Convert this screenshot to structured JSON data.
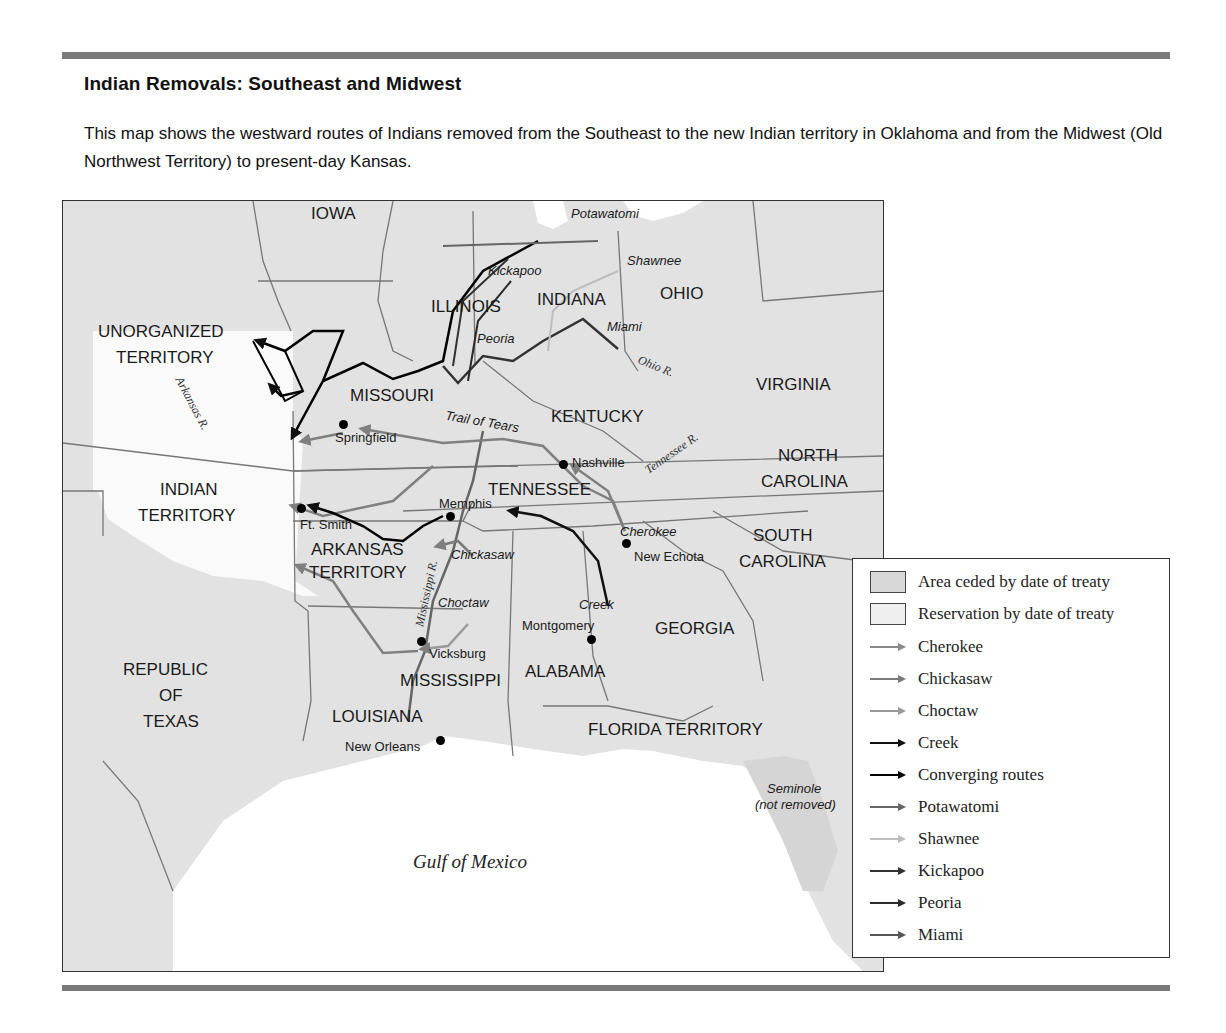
{
  "header": {
    "title": "Indian Removals: Southeast and Midwest",
    "description": "This map shows the westward routes of Indians removed from the Southeast to the new Indian territory in Oklahoma and from the Midwest (Old Northwest Territory) to present-day Kansas."
  },
  "map": {
    "states": {
      "iowa": "IOWA",
      "illinois": "ILLINOIS",
      "indiana": "INDIANA",
      "ohio": "OHIO",
      "unorganized_1": "UNORGANIZED",
      "unorganized_2": "TERRITORY",
      "missouri": "MISSOURI",
      "virginia": "VIRGINIA",
      "kentucky": "KENTUCKY",
      "north_carolina_1": "NORTH",
      "north_carolina_2": "CAROLINA",
      "indian_territory_1": "INDIAN",
      "indian_territory_2": "TERRITORY",
      "tennessee": "TENNESSEE",
      "south_carolina_1": "SOUTH",
      "south_carolina_2": "CAROLINA",
      "arkansas_1": "ARKANSAS",
      "arkansas_2": "TERRITORY",
      "georgia": "GEORGIA",
      "texas_1": "REPUBLIC",
      "texas_2": "OF",
      "texas_3": "TEXAS",
      "mississippi": "MISSISSIPPI",
      "alabama": "ALABAMA",
      "louisiana": "LOUISIANA",
      "florida": "FLORIDA TERRITORY"
    },
    "cities": {
      "springfield": "Springfield",
      "nashville": "Nashville",
      "memphis": "Memphis",
      "ft_smith": "Ft. Smith",
      "new_echota": "New Echota",
      "montgomery": "Montgomery",
      "vicksburg": "Vicksburg",
      "new_orleans": "New Orleans"
    },
    "tribe_labels": {
      "potawatomi": "Potawatomi",
      "kickapoo": "Kickapoo",
      "shawnee": "Shawnee",
      "peoria": "Peoria",
      "miami": "Miami",
      "trail_of_tears": "Trail of Tears",
      "cherokee": "Cherokee",
      "chickasaw": "Chickasaw",
      "choctaw": "Choctaw",
      "creek": "Creek",
      "seminole_1": "Seminole",
      "seminole_2": "(not removed)"
    },
    "rivers": {
      "arkansas": "Arkansas R.",
      "ohio": "Ohio R.",
      "tennessee": "Tennessee R.",
      "mississippi": "Mississippi R."
    },
    "water": {
      "gulf": "Gulf of Mexico"
    }
  },
  "legend": {
    "items": [
      {
        "label": "Area ceded by date of treaty",
        "type": "swatch",
        "color": "#d8d8d8"
      },
      {
        "label": "Reservation by date of treaty",
        "type": "swatch",
        "color": "#efefef"
      },
      {
        "label": "Cherokee",
        "type": "arrow",
        "color": "#8a8a8a"
      },
      {
        "label": "Chickasaw",
        "type": "arrow",
        "color": "#7a7a7a"
      },
      {
        "label": "Choctaw",
        "type": "arrow",
        "color": "#9a9a9a"
      },
      {
        "label": "Creek",
        "type": "arrow",
        "color": "#111111"
      },
      {
        "label": "Converging routes",
        "type": "arrow",
        "color": "#000000"
      },
      {
        "label": "Potawatomi",
        "type": "arrow",
        "color": "#666666"
      },
      {
        "label": "Shawnee",
        "type": "arrow",
        "color": "#bdbdbd"
      },
      {
        "label": "Kickapoo",
        "type": "arrow",
        "color": "#333333"
      },
      {
        "label": "Peoria",
        "type": "arrow",
        "color": "#2a2a2a"
      },
      {
        "label": "Miami",
        "type": "arrow",
        "color": "#555555"
      }
    ]
  }
}
